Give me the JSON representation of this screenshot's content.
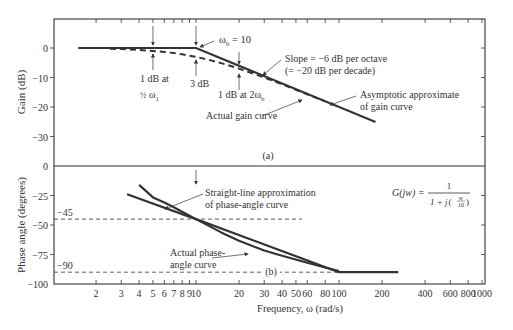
{
  "chart_data": [
    {
      "type": "line",
      "panel_label": "(a)",
      "title": "",
      "xlabel": "",
      "ylabel": "Gain (dB)",
      "xscale": "log",
      "xlim": [
        1,
        1000
      ],
      "ylim": [
        -40,
        10
      ],
      "yticks": [
        0,
        -10,
        -20,
        -30
      ],
      "ytick_labels": [
        "0",
        "-10",
        "-20",
        "-30"
      ],
      "series": [
        {
          "name": "Asymptotic approximate of gain curve",
          "style": "solid",
          "x": [
            1.5,
            10,
            180
          ],
          "y": [
            0,
            0,
            -25.1
          ]
        },
        {
          "name": "Actual gain curve",
          "style": "dashed",
          "x": [
            2.5,
            3,
            4,
            5,
            6,
            7,
            8,
            10,
            12,
            15,
            20,
            30,
            40,
            60,
            80
          ],
          "y": [
            -0.27,
            -0.37,
            -0.64,
            -0.97,
            -1.34,
            -1.73,
            -2.15,
            -3.01,
            -3.87,
            -5.12,
            -6.99,
            -10.0,
            -12.3,
            -15.7,
            -18.1
          ]
        }
      ],
      "annotations": [
        {
          "text": "ω_b = 10",
          "x": 10,
          "y": 0
        },
        {
          "text": "1 dB at ½ω₁",
          "x": 5,
          "y": -1
        },
        {
          "text": "3 dB",
          "x": 10,
          "y": -3
        },
        {
          "text": "1 dB at 2ω_b",
          "x": 20,
          "y": -6
        },
        {
          "text": "Slope = −6 dB per octave (= −20 dB per decade)"
        },
        {
          "text": "Asymptotic approximate of gain curve"
        },
        {
          "text": "Actual gain curve"
        }
      ]
    },
    {
      "type": "line",
      "panel_label": "(b)",
      "title": "",
      "xlabel": "Frequency, ω (rad/s)",
      "ylabel": "Phase angle (degrees)",
      "xscale": "log",
      "xlim": [
        1,
        1000
      ],
      "ylim": [
        -100,
        0
      ],
      "xticks": [
        2,
        3,
        4,
        5,
        6,
        7,
        8,
        9,
        10,
        20,
        30,
        40,
        50,
        60,
        80,
        100,
        200,
        400,
        600,
        800,
        1000
      ],
      "yticks": [
        0,
        -25,
        -50,
        -75,
        -100
      ],
      "reference_lines": [
        {
          "label": "-45",
          "y": -45,
          "x_end": 55
        },
        {
          "label": "-90",
          "y": -90,
          "x_end": 100
        }
      ],
      "series": [
        {
          "name": "Straight-line approximation of phase-angle curve",
          "style": "solid",
          "x": [
            3.3,
            10,
            100,
            260
          ],
          "y": [
            -24,
            -45,
            -90,
            -90
          ]
        },
        {
          "name": "Actual phase-angle curve",
          "style": "solid",
          "x": [
            4,
            5,
            6,
            7,
            8,
            10,
            15,
            20,
            30,
            40,
            60,
            80,
            100
          ],
          "y": [
            -16,
            -26.6,
            -31,
            -35,
            -38.7,
            -45,
            -56.3,
            -63.4,
            -71.6,
            -76,
            -82,
            -86,
            -89
          ]
        }
      ],
      "annotations": [
        {
          "text": "Straight-line approximation of phase-angle curve"
        },
        {
          "text": "Actual phase-angle curve"
        },
        {
          "text": "G(jw) = 1 / (1 + j(w/10))"
        }
      ]
    }
  ],
  "figure": {
    "gain_ylabel": "Gain (dB)",
    "phase_ylabel": "Phase angle (degrees)",
    "xlabel": "Frequency, ω (rad/s)",
    "panel_a": "(a)",
    "panel_b": "(b)",
    "gain_ticks": [
      "0",
      "−10",
      "−20",
      "−30"
    ],
    "divider_zero": "0",
    "phase_ticks": [
      "−25",
      "−50",
      "−75",
      "−100"
    ],
    "ref45": "−45",
    "ref90": "−90",
    "x_tick_labels": [
      "2",
      "3",
      "4",
      "5",
      "6",
      "7",
      "8",
      "9",
      "10",
      "20",
      "30",
      "40",
      "50",
      "60",
      "80",
      "100",
      "200",
      "400",
      "600",
      "800",
      "1000"
    ],
    "wb_label": "ω",
    "wb_sub": "b",
    "wb_eq": " = 10",
    "ann_1db_half": "1 dB at",
    "ann_half_w1": "ω",
    "ann_half_sub": "1",
    "ann_3db": "3 dB",
    "ann_1db_2wb": "1 dB at 2ω",
    "ann_1db_2wb_sub": "b",
    "ann_slope_1": "Slope = −6 dB per octave",
    "ann_slope_2": "(= −20 dB per decade)",
    "ann_asym_1": "Asymptotic approximate",
    "ann_asym_2": "of gain curve",
    "ann_actual_gain": "Actual gain curve",
    "ann_straight_1": "Straight-line approximation",
    "ann_straight_2": "of phase-angle curve",
    "ann_actual_phase_1": "Actual phase-",
    "ann_actual_phase_2": "angle curve",
    "formula_lhs": "G(jw) =",
    "formula_num": "1",
    "formula_den_pre": "1 + j",
    "formula_den_w": "w",
    "formula_den_10": "10",
    "color_line": "#333333"
  }
}
